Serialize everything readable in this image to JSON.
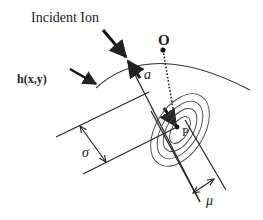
{
  "diagram": {
    "labels": {
      "incident_ion": "Incident Ion",
      "surface": "h(x,y)",
      "origin": "O",
      "point": "P",
      "depth": "a",
      "sigma": "σ",
      "mu": "μ"
    },
    "colors": {
      "ink": "#222222",
      "background": "#ffffff"
    }
  }
}
